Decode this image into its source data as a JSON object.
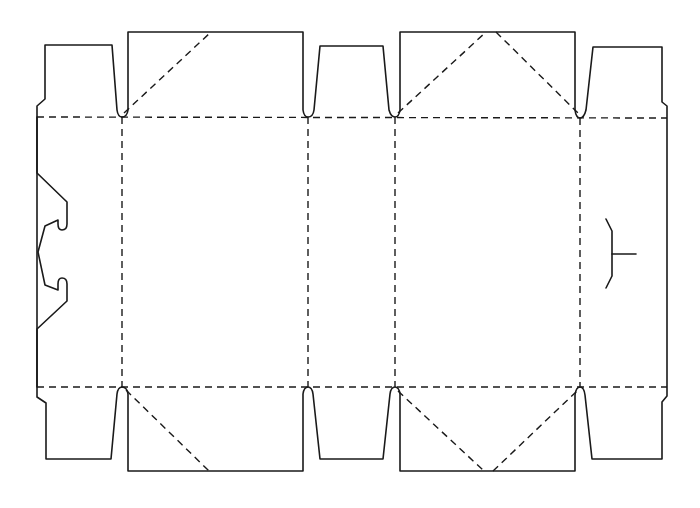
{
  "diagram": {
    "type": "box-dieline",
    "colors": {
      "cut_line": "#1a1a1a",
      "fold_line": "#1a1a1a",
      "background": "#ffffff"
    },
    "legend": {
      "solid": "cut line",
      "dashed": "fold line"
    },
    "fold_lines": {
      "horizontal": [
        {
          "name": "top-fold",
          "x1": 37,
          "y1": 117,
          "x2": 667,
          "y2": 118
        },
        {
          "name": "bottom-fold",
          "x1": 37,
          "y1": 387,
          "x2": 667,
          "y2": 387
        }
      ],
      "vertical": [
        {
          "name": "fold-1",
          "x": 122,
          "y1": 117,
          "y2": 387
        },
        {
          "name": "fold-2",
          "x": 308,
          "y1": 117,
          "y2": 387
        },
        {
          "name": "fold-3",
          "x": 395,
          "y1": 117,
          "y2": 387
        },
        {
          "name": "fold-4",
          "x": 580,
          "y1": 118,
          "y2": 387
        }
      ],
      "diagonal": [
        {
          "name": "top-panel1-diag",
          "x1": 124,
          "y1": 113,
          "x2": 211,
          "y2": 32
        },
        {
          "name": "top-panel2-diag-left",
          "x1": 398,
          "y1": 113,
          "x2": 486,
          "y2": 32
        },
        {
          "name": "top-panel2-diag-right",
          "x1": 496,
          "y1": 32,
          "x2": 578,
          "y2": 113
        },
        {
          "name": "bottom-panel1-diag",
          "x1": 126,
          "y1": 390,
          "x2": 209,
          "y2": 471
        },
        {
          "name": "bottom-panel2-diag-left",
          "x1": 398,
          "y1": 391,
          "x2": 484,
          "y2": 471
        },
        {
          "name": "bottom-panel2-diag-right",
          "x1": 493,
          "y1": 471,
          "x2": 577,
          "y2": 391
        }
      ]
    },
    "outline_path": "M 37 117 L 37 106 L 45 99 L 45 45 L 112 45 L 117 110 Q 118 117 122 117 Q 127 117 128 110 L 128 32 L 303 32 L 303 110 Q 304 117 308 117 Q 313 117 314 110 L 320 46 L 383 46 L 389 110 Q 391 117 395 117 Q 399 117 400 110 L 400 32 L 575 32 L 575 110 Q 576 118 580 118 Q 584 118 586 110 L 593 47 L 662 47 L 662 102 L 667 106 L 667 387 L 667 396 L 662 402 L 662 459 L 592 459 L 585 395 Q 584 387 580 387 Q 576 387 575 395 L 575 471 L 400 471 L 400 394 Q 399 387 395 387 Q 391 387 390 394 L 383 459 L 320 459 L 313 394 Q 312 387 308 387 Q 304 387 303 394 L 303 471 L 128 471 L 128 394 Q 127 387 122 387 Q 118 387 117 394 L 111 459 L 46 459 L 46 403 L 37 397 L 37 387 Z",
    "glue_flap_path": "M 37 117 L 37 173 L 67 202 L 67 224 Q 67 230 62 230 Q 58 230 58 224 L 58 220 L 45 226 L 38 252 L 45 285 L 58 290 L 58 284 Q 58 278 62 278 Q 67 278 67 284 L 67 301 L 37 329 L 37 387",
    "tuck_slot": {
      "vertical_path": "M 606 219 L 612 231 L 612 276 L 606 288",
      "tab_line": {
        "x1": 612,
        "y1": 254,
        "x2": 636,
        "y2": 254
      }
    },
    "panels": [
      {
        "name": "glue-flap",
        "x_range": [
          37,
          122
        ]
      },
      {
        "name": "front-panel",
        "x_range": [
          122,
          308
        ]
      },
      {
        "name": "side-panel-1",
        "x_range": [
          308,
          395
        ]
      },
      {
        "name": "back-panel",
        "x_range": [
          395,
          580
        ]
      },
      {
        "name": "side-panel-2",
        "x_range": [
          580,
          667
        ]
      }
    ]
  }
}
